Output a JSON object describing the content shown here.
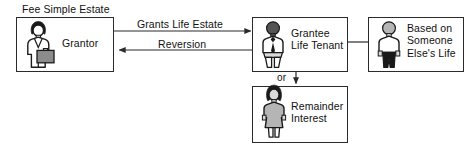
{
  "diagram": {
    "title_caption": "Fee Simple Estate",
    "background_color": "#ffffff",
    "line_color": "#2b2b2b",
    "text_color": "#111111",
    "figure_fill_light": "#d9d9d9",
    "figure_fill_dark": "#1a1a1a",
    "figure_fill_mid": "#8c8c8c",
    "nodes": [
      {
        "id": "grantor",
        "label": "Grantor",
        "figure_icon": "businesswoman-with-briefcase-icon",
        "caption": "Fee Simple Estate"
      },
      {
        "id": "grantee",
        "label": "Grantee\nLife Tenant",
        "figure_icon": "person-with-tie-icon"
      },
      {
        "id": "measuring_life",
        "label": "Based on\nSomeone\nElse's Life",
        "figure_icon": "person-dark-legs-icon"
      },
      {
        "id": "remainder",
        "label": "Remainder\nInterest",
        "figure_icon": "woman-in-dress-icon"
      }
    ],
    "edges": [
      {
        "id": "grants",
        "label": "Grants Life Estate",
        "from": "grantor",
        "to": "grantee",
        "direction": "right"
      },
      {
        "id": "reversion",
        "label": "Reversion",
        "from": "grantee",
        "to": "grantor",
        "direction": "left"
      },
      {
        "id": "measured_by",
        "label": "",
        "from": "grantee",
        "to": "measuring_life",
        "direction": "none"
      },
      {
        "id": "or_branch",
        "label": "or",
        "from": "grantee",
        "to": "remainder",
        "direction": "down"
      }
    ]
  }
}
